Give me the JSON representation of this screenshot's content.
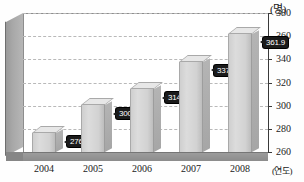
{
  "chart_data": {
    "type": "bar",
    "title": "",
    "xlabel": "(연도)",
    "ylabel": "(명)",
    "categories": [
      "2004",
      "2005",
      "2006",
      "2007",
      "2008"
    ],
    "values": [
      276.2,
      300.2,
      314.2,
      337.8,
      361.9
    ],
    "data_labels": [
      "276.2",
      "300.2",
      "314.2",
      "337.8",
      "361.9"
    ],
    "ylim": [
      260,
      380
    ],
    "yticks": [
      260,
      280,
      300,
      320,
      340,
      360,
      380
    ],
    "ytick_labels": [
      "260",
      "280",
      "300",
      "320",
      "340",
      "360",
      "380"
    ],
    "grid": true,
    "legend": false,
    "series": [
      {
        "name": "",
        "values": [
          276.2,
          300.2,
          314.2,
          337.8,
          361.9
        ]
      }
    ]
  },
  "axis": {
    "unit_top": "(명)",
    "unit_right": "(연도)"
  },
  "colors": {
    "bar_face": "#d6d6d6",
    "bar_top": "#e7e7e7",
    "bar_side": "#ababab",
    "badge_bg": "#1b1b1b",
    "badge_text": "#ffffff",
    "grid": "#b9b9b9",
    "axis": "#3a3a3a",
    "wall": "#a8a8a8",
    "floor": "#949494"
  }
}
